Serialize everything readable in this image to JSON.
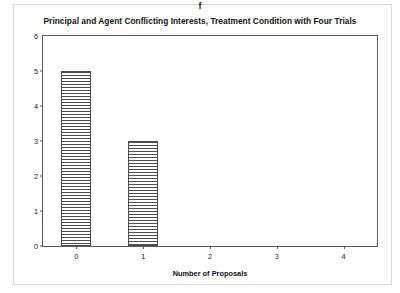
{
  "panel_label": "f",
  "chart_data": {
    "type": "bar",
    "title": "Principal and Agent Conflicting Interests, Treatment Condition with Four Trials",
    "xlabel": "Number of Proposals",
    "ylabel": "Number of Agents",
    "categories": [
      "0",
      "1",
      "2",
      "3",
      "4"
    ],
    "values": [
      5,
      3,
      0,
      0,
      0
    ],
    "ylim": [
      0,
      6
    ],
    "yticks": [
      "0",
      "1",
      "2",
      "3",
      "4",
      "5",
      "6"
    ],
    "grid": false,
    "legend": false,
    "bar_fill": "horizontal-line-hatch",
    "bar_edge_color": "#4a4a4a"
  }
}
